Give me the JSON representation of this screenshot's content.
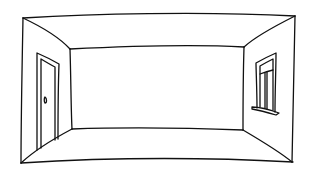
{
  "image": {
    "subject": "Hand-drawn sketch of an empty room in one-point perspective",
    "description": "Line drawing of an empty room with a door on the left wall and a window on the right wall",
    "colors": {
      "background": "#ffffff",
      "ink": "#111111"
    },
    "elements": [
      {
        "name": "ceiling",
        "label": "Ceiling"
      },
      {
        "name": "floor",
        "label": "Floor"
      },
      {
        "name": "back-wall",
        "label": "Back wall"
      },
      {
        "name": "left-wall",
        "label": "Left wall"
      },
      {
        "name": "right-wall",
        "label": "Right wall"
      },
      {
        "name": "door",
        "label": "Door with knob on left wall"
      },
      {
        "name": "window",
        "label": "Window with sill on right wall"
      }
    ]
  }
}
